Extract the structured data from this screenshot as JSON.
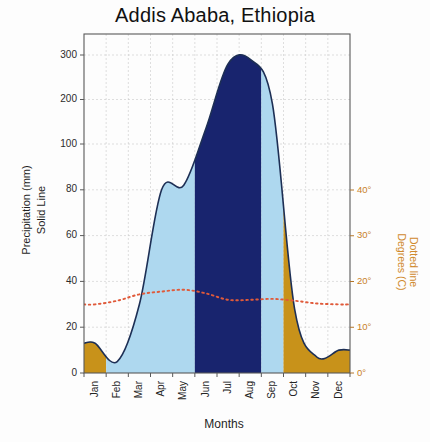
{
  "chart_data": {
    "type": "area",
    "title": "Addis Ababa, Ethiopia",
    "xlabel": "Months",
    "ylabel": "Precipitation (mm)\nSolid Line",
    "ylabel_line1": "Precipitation (mm)",
    "ylabel_line2": "Solid Line",
    "ylabel_right_line1": "Degrees (C)",
    "ylabel_right_line2": "Dotted line",
    "categories": [
      "Jan",
      "Feb",
      "Mar",
      "Apr",
      "May",
      "Jun",
      "Jul",
      "Aug",
      "Sep",
      "Oct",
      "Nov",
      "Dec"
    ],
    "grid": true,
    "legend_position": "none",
    "yaxis_left": {
      "label": "Precipitation (mm)",
      "sublabel": "Solid Line",
      "ticks": [
        0,
        20,
        40,
        60,
        80,
        100,
        200,
        300
      ],
      "tick_labels": [
        "0",
        "20",
        "40",
        "60",
        "80",
        "100",
        "200",
        "300"
      ],
      "ylim": [
        0,
        300
      ],
      "scale": "split-linear",
      "note": "linear 0-100, compressed 100-300"
    },
    "yaxis_right": {
      "label": "Degrees (C)",
      "sublabel": "Dotted line",
      "ticks": [
        0,
        10,
        20,
        30,
        40
      ],
      "tick_labels": [
        "0°",
        "10°",
        "20°",
        "30°",
        "40°"
      ],
      "ylim": [
        0,
        48
      ]
    },
    "series": [
      {
        "name": "Precipitation",
        "unit": "mm",
        "style": "solid line with filled area",
        "values": [
          13,
          5,
          30,
          80,
          82,
          135,
          280,
          290,
          190,
          28,
          7,
          10
        ]
      },
      {
        "name": "Temperature",
        "unit": "C",
        "style": "dotted line",
        "values": [
          15.0,
          15.8,
          17.2,
          17.8,
          18.2,
          17.4,
          16.0,
          16.0,
          16.2,
          15.8,
          15.2,
          15.0
        ]
      }
    ],
    "fill_bands": [
      {
        "name": "dry-season-early",
        "color": "#c8921a",
        "from_month": "Jan",
        "to_month": "Feb"
      },
      {
        "name": "humid-season-spring",
        "color": "#aed8ef",
        "from_month": "Feb",
        "to_month": "Jun"
      },
      {
        "name": "wet-season-summer",
        "color": "#18246e",
        "from_month": "Jun",
        "to_month": "Sep"
      },
      {
        "name": "humid-season-autumn",
        "color": "#aed8ef",
        "from_month": "Sep",
        "to_month": "Oct"
      },
      {
        "name": "dry-season-late",
        "color": "#c8921a",
        "from_month": "Oct",
        "to_month": "Dec"
      }
    ],
    "colors": {
      "dry": "#c8921a",
      "humid": "#aed8ef",
      "wet": "#18246e",
      "precip_line": "#1d2f55",
      "temp_line": "#e05a3a",
      "axis": "#5a5a5a",
      "right_axis_text": "#c87f28"
    }
  }
}
